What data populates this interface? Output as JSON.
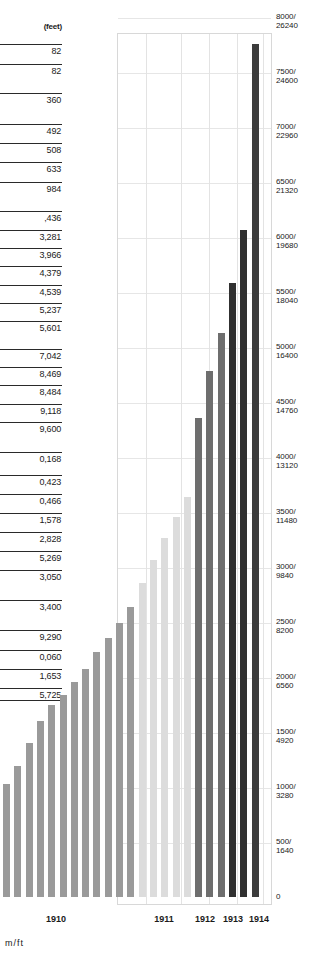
{
  "chart_data": {
    "type": "bar",
    "title": "",
    "subtitle": "",
    "xlabel": "",
    "ylabel": "m/ft",
    "left_header": "(feet)",
    "ylim": [
      0,
      8000
    ],
    "grid": true,
    "legend": "none",
    "categories": [
      "1910-1",
      "1910-2",
      "1910-3",
      "1910-4",
      "1910-5",
      "1910-6",
      "1910-7",
      "1910-8",
      "1910-9",
      "1910-10",
      "1910-11",
      "1910-12",
      "1911-1",
      "1911-2",
      "1911-3",
      "1911-4",
      "1911-5",
      "1912-1",
      "1912-2",
      "1912-3",
      "1913-1",
      "1913-2",
      "1914-1"
    ],
    "values": [
      1025,
      1195,
      1400,
      1600,
      1745,
      1835,
      1955,
      2070,
      2230,
      2350,
      2490,
      2640,
      2855,
      3060,
      3260,
      3450,
      3635,
      4350,
      4780,
      5130,
      5585,
      6060,
      7750
    ],
    "bar_shades": [
      "#9a9a9a",
      "#9a9a9a",
      "#9a9a9a",
      "#9a9a9a",
      "#9a9a9a",
      "#9a9a9a",
      "#9a9a9a",
      "#9a9a9a",
      "#9a9a9a",
      "#9a9a9a",
      "#9a9a9a",
      "#9a9a9a",
      "#dcdcdc",
      "#dcdcdc",
      "#dcdcdc",
      "#dcdcdc",
      "#dcdcdc",
      "#6e6e6e",
      "#6e6e6e",
      "#6e6e6e",
      "#303030",
      "#303030",
      "#3c3c3c"
    ],
    "year_groups": [
      {
        "label": "1910",
        "center_px": 56
      },
      {
        "label": "1911",
        "center_px": 164
      },
      {
        "label": "1912",
        "center_px": 205
      },
      {
        "label": "1913",
        "center_px": 233
      },
      {
        "label": "1914",
        "center_px": 259
      }
    ],
    "right_axis_ticks": [
      {
        "m": "8000/",
        "ft": "26240",
        "y": 17
      },
      {
        "m": "7500/",
        "ft": "24600",
        "y": 72
      },
      {
        "m": "7000/",
        "ft": "22960",
        "y": 127
      },
      {
        "m": "6500/",
        "ft": "21320",
        "y": 182
      },
      {
        "m": "6000/",
        "ft": "19680",
        "y": 237
      },
      {
        "m": "5500/",
        "ft": "18040",
        "y": 292
      },
      {
        "m": "5000/",
        "ft": "16400",
        "y": 347
      },
      {
        "m": "4500/",
        "ft": "14760",
        "y": 402
      },
      {
        "m": "4000/",
        "ft": "13120",
        "y": 457
      },
      {
        "m": "3500/",
        "ft": "11480",
        "y": 512
      },
      {
        "m": "3000/",
        "ft": "9840",
        "y": 567
      },
      {
        "m": "2500/",
        "ft": "8200",
        "y": 622
      },
      {
        "m": "2000/",
        "ft": "6560",
        "y": 677
      },
      {
        "m": "1500/",
        "ft": "4920",
        "y": 732
      },
      {
        "m": "1000/",
        "ft": "3280",
        "y": 787
      },
      {
        "m": "500/",
        "ft": "1640",
        "y": 842
      },
      {
        "m": "0",
        "ft": "",
        "y": 897
      }
    ],
    "right_unit": "m/ft",
    "left_labels": [
      {
        "text": "82",
        "y": 44,
        "closing": true
      },
      {
        "text": "82",
        "y": 64,
        "closing": true
      },
      {
        "text": "360",
        "y": 93,
        "closing": true
      },
      {
        "text": "492",
        "y": 124,
        "closing": true
      },
      {
        "text": "508",
        "y": 143,
        "closing": true
      },
      {
        "text": "633",
        "y": 162,
        "closing": true
      },
      {
        "text": "984",
        "y": 182,
        "closing": true
      },
      {
        "text": ",436",
        "y": 211,
        "closing": true
      },
      {
        "text": "3,281",
        "y": 230,
        "closing": true
      },
      {
        "text": "3,966",
        "y": 248,
        "closing": true
      },
      {
        "text": "4,379",
        "y": 266,
        "closing": true
      },
      {
        "text": "4,539",
        "y": 285,
        "closing": true
      },
      {
        "text": "5,237",
        "y": 303,
        "closing": true
      },
      {
        "text": "5,601",
        "y": 321,
        "closing": true
      },
      {
        "text": "7,042",
        "y": 349,
        "closing": true
      },
      {
        "text": "8,469",
        "y": 367,
        "closing": true
      },
      {
        "text": "8,484",
        "y": 385,
        "closing": true
      },
      {
        "text": "9,118",
        "y": 404,
        "closing": true
      },
      {
        "text": "9,600",
        "y": 422,
        "closing": true
      },
      {
        "text": "0,168",
        "y": 452,
        "closing": true
      },
      {
        "text": "0,423",
        "y": 475,
        "closing": true
      },
      {
        "text": "0,466",
        "y": 494,
        "closing": true
      },
      {
        "text": "1,578",
        "y": 513,
        "closing": true
      },
      {
        "text": "2,828",
        "y": 532,
        "closing": true
      },
      {
        "text": "5,269",
        "y": 551,
        "closing": true
      },
      {
        "text": "3,050",
        "y": 570,
        "closing": true
      },
      {
        "text": "3,400",
        "y": 600,
        "closing": true
      },
      {
        "text": "9,290",
        "y": 630,
        "closing": true
      },
      {
        "text": "0,060",
        "y": 650,
        "closing": true
      },
      {
        "text": "1,653",
        "y": 669,
        "closing": true
      },
      {
        "text": "5,725",
        "y": 688,
        "closing": true
      }
    ],
    "hgrid_y": [
      17,
      72,
      127,
      182,
      237,
      292,
      347,
      402,
      457,
      512,
      567,
      622,
      677,
      732,
      787,
      842
    ],
    "vgrid_x": [
      145,
      180,
      208,
      236,
      262
    ]
  }
}
